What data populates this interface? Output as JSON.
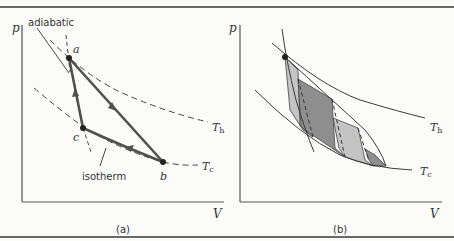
{
  "figure": {
    "panel_a": {
      "caption": "(a)",
      "axis_y": "p",
      "axis_x": "V",
      "labels": {
        "adiabatic": "adiabatic",
        "isotherm": "isotherm",
        "point_a": "a",
        "point_b": "b",
        "point_c": "c",
        "t_hot": "T",
        "t_hot_sub": "h",
        "t_cold": "T",
        "t_cold_sub": "c"
      }
    },
    "panel_b": {
      "caption": "(b)",
      "axis_y": "p",
      "axis_x": "V",
      "labels": {
        "t_hot": "T",
        "t_hot_sub": "h",
        "t_cold": "T",
        "t_cold_sub": "c"
      }
    },
    "colors": {
      "line": "#3a3a3a",
      "path": "#505050",
      "shade_light": "#c4c4c4",
      "shade_dark": "#8e8e8e",
      "rule": "#6a6a6a"
    }
  }
}
